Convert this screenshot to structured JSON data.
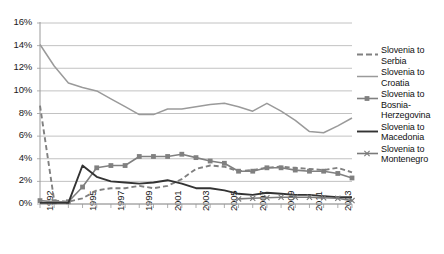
{
  "chart_data": {
    "type": "line",
    "title": "",
    "subtitle": "",
    "xlabel": "",
    "ylabel": "",
    "ylim": [
      0,
      16
    ],
    "ytick_values": [
      0,
      2,
      4,
      6,
      8,
      10,
      12,
      14,
      16
    ],
    "ytick_labels": [
      "0%",
      "2%",
      "4%",
      "6%",
      "8%",
      "10%",
      "12%",
      "14%",
      "16%"
    ],
    "grid": true,
    "legend_position": "right",
    "x": [
      1992,
      1993,
      1994,
      1995,
      1996,
      1997,
      1998,
      1999,
      2000,
      2001,
      2002,
      2003,
      2004,
      2005,
      2006,
      2007,
      2008,
      2009,
      2010,
      2011,
      2012,
      2013,
      2014
    ],
    "xlim": [
      1992,
      2014
    ],
    "xtick_labels": [
      "1992",
      "1995",
      "1997",
      "1999",
      "2001",
      "2003",
      "2005",
      "2007",
      "2009",
      "2011",
      "2013"
    ],
    "xtick_label_values": [
      1992,
      1995,
      1997,
      1999,
      2001,
      2003,
      2005,
      2007,
      2009,
      2011,
      2013
    ],
    "series": [
      {
        "name": "Slovenia to Serbia",
        "style": "dashed",
        "color": "#808080",
        "marker": "none",
        "values": [
          8.7,
          0.3,
          0.2,
          0.5,
          1.2,
          1.4,
          1.4,
          1.6,
          1.4,
          1.6,
          2.2,
          3.1,
          3.4,
          3.3,
          2.9,
          3.0,
          3.2,
          3.3,
          3.2,
          3.1,
          3.0,
          3.2,
          2.8
        ]
      },
      {
        "name": "Slovenia to Croatia",
        "style": "solid-thin",
        "color": "#9a9a9a",
        "marker": "none",
        "values": [
          14.1,
          12.2,
          10.7,
          10.3,
          10.0,
          9.3,
          8.6,
          7.9,
          7.9,
          8.4,
          8.4,
          8.6,
          8.8,
          8.9,
          8.6,
          8.2,
          8.9,
          8.2,
          7.4,
          6.4,
          6.3,
          6.9,
          7.6
        ]
      },
      {
        "name": "Slovenia to Bosnia-Herzegovina",
        "style": "solid-marker",
        "color": "#808080",
        "marker": "square",
        "values": [
          0.3,
          0.2,
          0.2,
          1.5,
          3.2,
          3.4,
          3.4,
          4.2,
          4.2,
          4.2,
          4.4,
          4.1,
          3.8,
          3.6,
          2.9,
          2.9,
          3.2,
          3.2,
          3.0,
          2.9,
          2.9,
          2.7,
          2.3
        ]
      },
      {
        "name": "Slovenia to Macedonia",
        "style": "solid-thick",
        "color": "#333333",
        "marker": "none",
        "values": [
          0.1,
          0.1,
          0.1,
          3.4,
          2.4,
          2.0,
          1.9,
          1.8,
          1.9,
          2.1,
          1.8,
          1.4,
          1.4,
          1.2,
          0.9,
          0.8,
          1.0,
          0.9,
          0.8,
          0.8,
          0.7,
          0.6,
          0.6
        ]
      },
      {
        "name": "Slovenia to Montenegro",
        "style": "solid-marker",
        "color": "#7a7a7a",
        "marker": "cross",
        "values": [
          null,
          null,
          null,
          null,
          null,
          null,
          null,
          null,
          null,
          null,
          null,
          null,
          null,
          null,
          0.45,
          0.5,
          0.55,
          0.6,
          0.6,
          0.6,
          0.55,
          0.5,
          0.3
        ]
      }
    ]
  },
  "legend": {
    "entries": [
      {
        "label": "Slovenia to Serbia"
      },
      {
        "label": "Slovenia to Croatia"
      },
      {
        "label": "Slovenia to Bosnia-Herzegovina"
      },
      {
        "label": "Slovenia to Macedonia"
      },
      {
        "label": "Slovenia to Montenegro"
      }
    ]
  },
  "colors": {
    "serbia": "#808080",
    "croatia": "#9a9a9a",
    "bosnia": "#808080",
    "macedonia": "#333333",
    "montenegro": "#7a7a7a",
    "grid": "#b3b3b3",
    "axis": "#9a9a9a",
    "text": "#1a1a1a"
  }
}
